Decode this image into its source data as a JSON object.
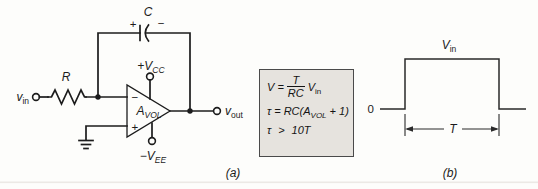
{
  "panel_a": {
    "caption": "(a)",
    "vin_main": "v",
    "vin_sub": "in",
    "resistor_label": "R",
    "capacitor_label": "C",
    "cap_plus": "+",
    "cap_minus": "−",
    "opamp_minus": "−",
    "opamp_plus": "+",
    "gain_main": "A",
    "gain_sub": "VOL",
    "vcc_main": "+V",
    "vcc_sub": "CC",
    "vee_main": "−V",
    "vee_sub": "EE",
    "vout_main": "v",
    "vout_sub": "out"
  },
  "equation_box": {
    "line1_lhs": "V =",
    "line1_num": "T",
    "line1_den": "RC",
    "line1_rhs_main": "V",
    "line1_rhs_sub": "in",
    "line2_pre": "τ = RC(A",
    "line2_sub": "VOL",
    "line2_post": " + 1)",
    "line3_lhs": "τ",
    "line3_rel": ">",
    "line3_rhs": "10T"
  },
  "panel_b": {
    "caption": "(b)",
    "zero_label": "0",
    "vin_main": "V",
    "vin_sub": "in",
    "period_label": "T"
  },
  "colors": {
    "ink": "#1c1c1c",
    "box_fill": "#e6e3de",
    "box_border": "#4a4a4a",
    "page": "#fdfdfb",
    "page_edge": "#ece9e5"
  }
}
